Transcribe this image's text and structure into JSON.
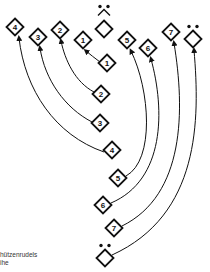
{
  "diagram": {
    "type": "formation-change",
    "colors": {
      "stroke": "#111111",
      "background": "#ffffff"
    },
    "caption_lines": [
      "hützenrudels",
      "ihe"
    ],
    "top_row": [
      {
        "label": "4",
        "x": 15,
        "y": 27
      },
      {
        "label": "3",
        "x": 38,
        "y": 37
      },
      {
        "label": "2",
        "x": 60,
        "y": 30
      },
      {
        "label": "1",
        "x": 83,
        "y": 40
      },
      {
        "label": "",
        "x": 104,
        "y": 29,
        "role": "leader",
        "marker": "dots-chevron"
      },
      {
        "label": "5",
        "x": 127,
        "y": 40
      },
      {
        "label": "6",
        "x": 148,
        "y": 48
      },
      {
        "label": "7",
        "x": 171,
        "y": 32
      },
      {
        "label": "",
        "x": 193,
        "y": 39,
        "role": "leader",
        "marker": "dots"
      }
    ],
    "column": [
      {
        "label": "1",
        "x": 107,
        "y": 63
      },
      {
        "label": "2",
        "x": 101,
        "y": 94
      },
      {
        "label": "3",
        "x": 100,
        "y": 123
      },
      {
        "label": "4",
        "x": 112,
        "y": 150
      },
      {
        "label": "5",
        "x": 118,
        "y": 178
      },
      {
        "label": "6",
        "x": 103,
        "y": 205
      },
      {
        "label": "7",
        "x": 114,
        "y": 228
      },
      {
        "label": "",
        "x": 105,
        "y": 258,
        "role": "leader",
        "marker": "dots"
      }
    ]
  }
}
